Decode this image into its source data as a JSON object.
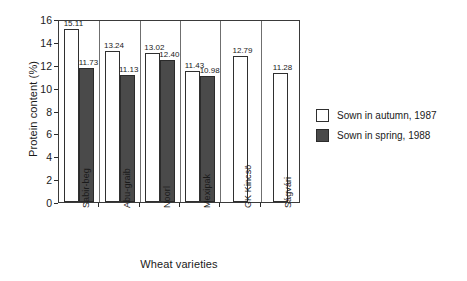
{
  "chart_data": {
    "type": "bar",
    "title": "",
    "xlabel": "Wheat varieties",
    "ylabel": "Protein content (%)",
    "categories": [
      "Sabir-beg",
      "Abu-graib",
      "Noorl",
      "Mexipak",
      "GK Kincsö",
      "Ságvári"
    ],
    "ylim": [
      0,
      16
    ],
    "yticks": [
      "0",
      "2",
      "4",
      "6",
      "8",
      "10",
      "12",
      "14",
      "16"
    ],
    "grid": false,
    "legend_position": "right",
    "series": [
      {
        "name": "Sown in autumn, 1987",
        "color": "#ffffff",
        "values": [
          15.11,
          13.24,
          13.02,
          11.43,
          12.79,
          11.28
        ],
        "labels": [
          "15.11",
          "13.24",
          "13.02",
          "11.43",
          "12.79",
          "11.28"
        ]
      },
      {
        "name": "Sown in spring, 1988",
        "color": "#4a4a4a",
        "values": [
          11.73,
          11.13,
          12.4,
          10.98,
          null,
          null
        ],
        "labels": [
          "11.73",
          "11.13",
          "12.40",
          "10.98",
          "",
          ""
        ]
      }
    ]
  },
  "legend": {
    "items": [
      {
        "label": "Sown in autumn, 1987",
        "swatch": "autumn"
      },
      {
        "label": "Sown in spring, 1988",
        "swatch": "spring"
      }
    ]
  }
}
